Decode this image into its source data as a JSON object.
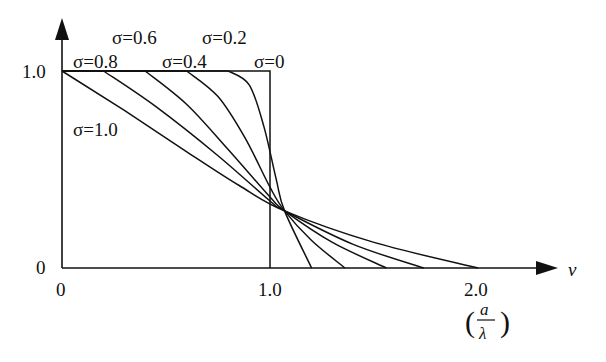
{
  "chart_data": {
    "type": "line",
    "title": "",
    "xlabel": "v",
    "xlabel_unit": "(a/λ)",
    "ylabel": "",
    "xlim": [
      0,
      2.2
    ],
    "ylim": [
      0,
      1.0
    ],
    "grid": false,
    "x_ticks": [
      {
        "value": 0,
        "label": "0"
      },
      {
        "value": 1.0,
        "label": "1.0"
      },
      {
        "value": 2.0,
        "label": "2.0"
      }
    ],
    "y_ticks": [
      {
        "value": 0,
        "label": "0"
      },
      {
        "value": 1.0,
        "label": "1.0"
      }
    ],
    "series": [
      {
        "name": "σ=0",
        "points": [
          [
            0,
            1.0
          ],
          [
            1.0,
            1.0
          ],
          [
            1.0,
            0
          ]
        ]
      },
      {
        "name": "σ=0.2",
        "points": [
          [
            0,
            1.0
          ],
          [
            0.8,
            1.0
          ],
          [
            0.9,
            0.93
          ],
          [
            0.97,
            0.72
          ],
          [
            1.03,
            0.45
          ],
          [
            1.07,
            0.29
          ],
          [
            1.2,
            0
          ]
        ]
      },
      {
        "name": "σ=0.4",
        "points": [
          [
            0,
            1.0
          ],
          [
            0.6,
            1.0
          ],
          [
            0.75,
            0.87
          ],
          [
            0.88,
            0.66
          ],
          [
            1.0,
            0.41
          ],
          [
            1.07,
            0.29
          ],
          [
            1.2,
            0.14
          ],
          [
            1.36,
            0
          ]
        ]
      },
      {
        "name": "σ=0.6",
        "points": [
          [
            0,
            1.0
          ],
          [
            0.4,
            1.0
          ],
          [
            0.6,
            0.83
          ],
          [
            0.8,
            0.6
          ],
          [
            1.0,
            0.36
          ],
          [
            1.07,
            0.29
          ],
          [
            1.3,
            0.13
          ],
          [
            1.56,
            0
          ]
        ]
      },
      {
        "name": "σ=0.8",
        "points": [
          [
            0,
            1.0
          ],
          [
            0.2,
            1.0
          ],
          [
            0.45,
            0.82
          ],
          [
            0.75,
            0.57
          ],
          [
            1.0,
            0.34
          ],
          [
            1.07,
            0.29
          ],
          [
            1.4,
            0.12
          ],
          [
            1.74,
            0
          ]
        ]
      },
      {
        "name": "σ=1.0",
        "points": [
          [
            0,
            1.0
          ],
          [
            0.3,
            0.8
          ],
          [
            0.6,
            0.59
          ],
          [
            0.85,
            0.42
          ],
          [
            1.07,
            0.29
          ],
          [
            1.5,
            0.13
          ],
          [
            2.0,
            0
          ]
        ]
      }
    ],
    "annotations": [
      {
        "text": "σ=0.6",
        "anchor_series": "σ=0.6"
      },
      {
        "text": "σ=0.2",
        "anchor_series": "σ=0.2"
      },
      {
        "text": "σ=0.8",
        "anchor_series": "σ=0.8"
      },
      {
        "text": "σ=0.4",
        "anchor_series": "σ=0.4"
      },
      {
        "text": "σ=0",
        "anchor_series": "σ=0"
      },
      {
        "text": "σ=1.0",
        "anchor_series": "σ=1.0"
      }
    ]
  }
}
